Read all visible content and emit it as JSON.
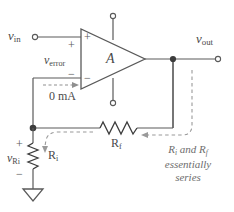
{
  "diagram": {
    "colors": {
      "wire": "#5a5a5a",
      "wire_dark": "#3c3c3c",
      "text": "#4a4a4a",
      "note_text": "#6d6d6d",
      "dashed": "#9a9a9a",
      "background": "#ffffff"
    }
  },
  "labels": {
    "v_in": {
      "base": "v",
      "sub": "in"
    },
    "v_out": {
      "base": "v",
      "sub": "out"
    },
    "v_error": {
      "base": "v",
      "sub": "error"
    },
    "v_ri": {
      "base": "v",
      "sub": "Ri"
    },
    "gain": "A",
    "current_zero": "0 mA",
    "rf": {
      "base": "R",
      "sub": "f"
    },
    "ri": {
      "base": "R",
      "sub": "i"
    }
  },
  "signs": {
    "noninv_input_plus": "+",
    "inv_input_minus": "−",
    "v_error_plus": "+",
    "v_error_minus": "−",
    "v_ri_plus": "+",
    "v_ri_minus": "−"
  },
  "annotation": {
    "line1_pre": "R",
    "line1_sub1": "i",
    "line1_mid": " and R",
    "line1_sub2": "f",
    "line2": "essentially",
    "line3": "series"
  },
  "terminals": {
    "input_terminal": "open-circle",
    "output_terminal": "open-circle",
    "positive_supply_terminal": "open-circle",
    "negative_supply_terminal": "open-circle",
    "ground_symbol": "earth-triangle"
  }
}
